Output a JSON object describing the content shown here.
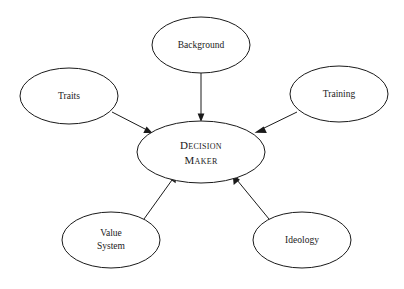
{
  "diagram": {
    "type": "radial-concept-map",
    "background_color": "#ffffff",
    "stroke_color": "#1a1a1a",
    "center": {
      "id": "decision-maker",
      "label_line1": "Decision",
      "label_line2": "Maker",
      "text_style": "small-caps",
      "cx": 201,
      "cy": 152,
      "rx": 64,
      "ry": 31
    },
    "nodes": [
      {
        "id": "background",
        "label": "Background",
        "cx": 201,
        "cy": 45,
        "rx": 49,
        "ry": 28
      },
      {
        "id": "traits",
        "label": "Traits",
        "cx": 69,
        "cy": 96,
        "rx": 49,
        "ry": 28
      },
      {
        "id": "training",
        "label": "Training",
        "cx": 339,
        "cy": 94,
        "rx": 49,
        "ry": 28
      },
      {
        "id": "value-system",
        "label_line1": "Value",
        "label_line2": "System",
        "cx": 111,
        "cy": 240,
        "rx": 49,
        "ry": 28
      },
      {
        "id": "ideology",
        "label": "Ideology",
        "cx": 302,
        "cy": 240,
        "rx": 49,
        "ry": 28
      }
    ],
    "edges": [
      {
        "id": "edge-background-to-center",
        "from": "background",
        "to": "decision-maker",
        "direction": "inward"
      },
      {
        "id": "edge-traits-to-center",
        "from": "traits",
        "to": "decision-maker",
        "direction": "inward"
      },
      {
        "id": "edge-training-to-center",
        "from": "training",
        "to": "decision-maker",
        "direction": "inward"
      },
      {
        "id": "edge-value-system-to-center",
        "from": "value-system",
        "to": "decision-maker",
        "direction": "inward"
      },
      {
        "id": "edge-ideology-to-center",
        "from": "ideology",
        "to": "decision-maker",
        "direction": "inward"
      }
    ]
  }
}
